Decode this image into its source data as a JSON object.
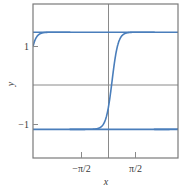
{
  "figure": {
    "background": "#ffffff",
    "frame_color": "#7a7a7a",
    "axis_color": "#808080",
    "curve_color": "#4a7ebb",
    "text_color": "#3a3a3a"
  },
  "chart_data": {
    "type": "line",
    "title": "",
    "xlabel": "x",
    "ylabel": "y",
    "xlim": [
      -2.9452,
      2.4544
    ],
    "ylim": [
      -1.59,
      1.58
    ],
    "xticks": [
      -1.5708,
      1.5708
    ],
    "xticklabels": [
      "−π/2",
      "π/2"
    ],
    "yticks": [
      -1,
      1
    ],
    "yticklabels": [
      "−1",
      "1"
    ],
    "grid": false,
    "legend": null,
    "axis_lines": {
      "x_axis_at_y": 0,
      "y_axis_at_x": 0
    },
    "period": 3.14159,
    "amplitude": 1,
    "plateau_high": 1,
    "plateau_low": -1,
    "series": [
      {
        "name": "y",
        "formula": "tanh(a*tan(x/2 shifted)) periodic ramp between -1 and 1, period pi",
        "color": "#4a7ebb",
        "linewidth": 1.6,
        "x": [
          -2.9452,
          -2.87,
          -2.79,
          -2.7,
          -2.6,
          -2.5,
          -2.4,
          -2.3,
          -2.2,
          -2.1,
          -2.0,
          -1.9,
          -1.8,
          -1.7,
          -1.6,
          -1.5,
          -1.4,
          -1.3,
          -1.2,
          -1.1,
          -1.0,
          -0.9,
          -0.8,
          -0.7,
          -0.6,
          -0.5,
          -0.4,
          -0.3,
          -0.2,
          -0.1,
          0.0,
          0.1,
          0.2,
          0.3,
          0.4,
          0.5,
          0.6,
          0.7,
          0.8,
          0.9,
          1.0,
          1.1,
          1.2,
          1.3,
          1.4,
          1.5,
          1.6,
          1.7,
          1.8,
          1.9,
          2.0,
          2.1,
          2.2,
          2.3,
          2.4,
          2.4544
        ],
        "y": [
          -0.4,
          -0.22,
          -0.02,
          0.22,
          0.5,
          0.72,
          0.86,
          0.93,
          0.97,
          0.99,
          1.0,
          1.0,
          1.0,
          1.0,
          -1.0,
          -1.0,
          -1.0,
          -0.99,
          -0.97,
          -0.93,
          -0.86,
          -0.72,
          -0.5,
          -0.22,
          0.08,
          0.38,
          0.64,
          0.82,
          0.93,
          0.98,
          1.0,
          1.0,
          1.0,
          1.0,
          1.0,
          1.0,
          1.0,
          -1.0,
          -1.0,
          -1.0,
          -1.0,
          -0.99,
          -0.97,
          -0.92,
          -0.83,
          -0.66,
          -0.42,
          -0.12,
          0.2,
          0.5,
          0.73,
          0.88,
          0.95,
          0.98,
          1.0,
          1.0
        ]
      }
    ],
    "horizontal_reference_lines": [
      {
        "y": 1,
        "color": "#4a7ebb"
      },
      {
        "y": -1,
        "color": "#4a7ebb"
      }
    ]
  }
}
